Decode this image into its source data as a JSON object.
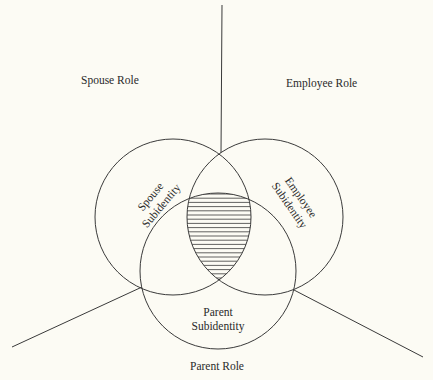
{
  "diagram": {
    "roles": {
      "spouse": "Spouse Role",
      "employee": "Employee Role",
      "parent": "Parent Role"
    },
    "subidentities": {
      "spouse": [
        "Spouse",
        "Subidentity"
      ],
      "employee": [
        "Employee",
        "Subidentity"
      ],
      "parent": [
        "Parent",
        "Subidentity"
      ]
    },
    "colors": {
      "background": "#fcfbf4",
      "stroke": "#3a3a3a",
      "text": "#2a2a2a"
    }
  }
}
